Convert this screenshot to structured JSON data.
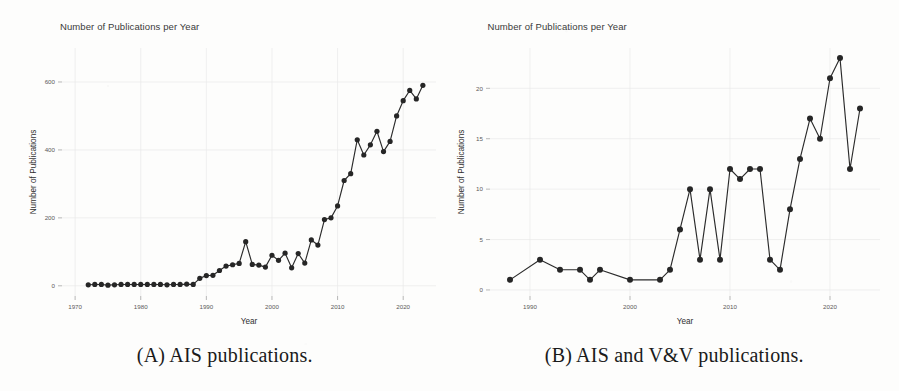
{
  "figure": {
    "panels": [
      {
        "id": "panel-a",
        "caption": "(A) AIS publications.",
        "title": "Number of Publications per Year",
        "chart_data": {
          "type": "line",
          "title": "Number of Publications per Year",
          "xlabel": "Year",
          "ylabel": "Number of Publications",
          "xlim": [
            1968,
            2025
          ],
          "ylim": [
            -30,
            700
          ],
          "xticks": [
            1970,
            1980,
            1990,
            2000,
            2010,
            2020
          ],
          "yticks": [
            0,
            200,
            400,
            600
          ],
          "grid": true,
          "legend": "none",
          "marker": "filled-circle",
          "x": [
            1972,
            1973,
            1974,
            1975,
            1976,
            1977,
            1978,
            1979,
            1980,
            1981,
            1982,
            1983,
            1984,
            1985,
            1986,
            1987,
            1988,
            1989,
            1990,
            1991,
            1992,
            1993,
            1994,
            1995,
            1996,
            1997,
            1998,
            1999,
            2000,
            2001,
            2002,
            2003,
            2004,
            2005,
            2006,
            2007,
            2008,
            2009,
            2010,
            2011,
            2012,
            2013,
            2014,
            2015,
            2016,
            2017,
            2018,
            2019,
            2020,
            2021,
            2022,
            2023
          ],
          "y": [
            3,
            4,
            4,
            2,
            3,
            4,
            4,
            4,
            4,
            4,
            4,
            4,
            3,
            4,
            4,
            5,
            4,
            22,
            30,
            31,
            45,
            58,
            62,
            66,
            130,
            63,
            61,
            55,
            90,
            75,
            96,
            53,
            95,
            67,
            135,
            120,
            195,
            200,
            235,
            310,
            330,
            430,
            385,
            415,
            455,
            395,
            425,
            500,
            545,
            575,
            550,
            590,
            655,
            680
          ],
          "note": "Annual count of AIS publications; steep growth after 2003, peak ~680 in 2023"
        }
      },
      {
        "id": "panel-b",
        "caption": "(B) AIS and V&V publications.",
        "title": "Number of Publications per Year",
        "chart_data": {
          "type": "line",
          "title": "Number of Publications per Year",
          "xlabel": "Year",
          "ylabel": "Number of Publications",
          "xlim": [
            1986,
            2025
          ],
          "ylim": [
            -0.6,
            24
          ],
          "xticks": [
            1990,
            2000,
            2010,
            2020
          ],
          "yticks": [
            0,
            5,
            10,
            15,
            20
          ],
          "grid": true,
          "legend": "none",
          "marker": "filled-circle",
          "x": [
            1988,
            1991,
            1993,
            1995,
            1996,
            1997,
            2000,
            2003,
            2004,
            2005,
            2006,
            2007,
            2008,
            2009,
            2010,
            2011,
            2012,
            2013,
            2014,
            2015,
            2016,
            2017,
            2018,
            2019,
            2020,
            2021,
            2022,
            2023
          ],
          "y": [
            1,
            3,
            2,
            2,
            1,
            2,
            1,
            1,
            2,
            6,
            10,
            3,
            10,
            3,
            12,
            11,
            12,
            12,
            3,
            2,
            8,
            13,
            17,
            15,
            21,
            23,
            12,
            18
          ],
          "note": "Annual count of combined AIS and V&V publications; peak of 23 in 2021"
        }
      }
    ]
  }
}
